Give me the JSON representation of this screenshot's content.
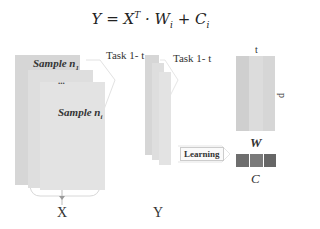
{
  "formula": {
    "lhs": "Y = X",
    "sup": "T",
    "mid": " · W",
    "sub1": "i",
    "plus": " + C",
    "sub2": "i"
  },
  "input_block": {
    "samples": [
      {
        "label": "Sample n",
        "subscript": "1"
      },
      {
        "label": "Sample n",
        "subscript": "i"
      }
    ],
    "ellipsis": "...",
    "axis_label": "X"
  },
  "task_labels": [
    "Task 1- t",
    "Task 1- t"
  ],
  "output_block": {
    "axis_label": "Y"
  },
  "learning": {
    "label": "Learning"
  },
  "weight_matrix": {
    "label": "W",
    "top_dim": "t",
    "side_dim": "p",
    "colors": [
      "#cfcfcf",
      "#dcdcdc",
      "#d5d5d5"
    ]
  },
  "bias_vector": {
    "label": "C",
    "colors": [
      "#6e6e6e",
      "#7a7a7a",
      "#666666"
    ]
  }
}
